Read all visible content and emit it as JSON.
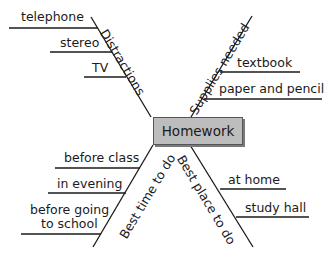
{
  "center": {
    "label": "Homework"
  },
  "branches": [
    {
      "category": "Distractions",
      "items": [
        "telephone",
        "stereo",
        "TV"
      ]
    },
    {
      "category": "Supplies needed",
      "items": [
        "textbook",
        "paper and pencil"
      ]
    },
    {
      "category": "Best time to do",
      "items": [
        "before class",
        "in evening",
        "before going",
        "to school"
      ]
    },
    {
      "category": "Best place to do",
      "items": [
        "at home",
        "study hall"
      ]
    }
  ],
  "colors": {
    "box_fill": "#bdbdbd",
    "line": "#1a1a1a",
    "background": "#ffffff"
  }
}
